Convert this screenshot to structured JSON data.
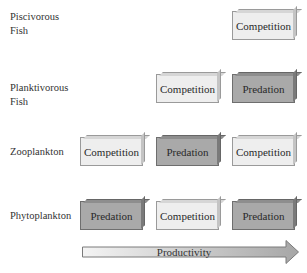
{
  "rows": [
    {
      "label_lines": [
        "Piscivorous",
        "Fish"
      ],
      "cells": [
        null,
        null,
        "Competition"
      ]
    },
    {
      "label_lines": [
        "Planktivorous",
        "Fish"
      ],
      "cells": [
        null,
        "Competition",
        "Predation"
      ]
    },
    {
      "label_lines": [
        "Zooplankton"
      ],
      "cells": [
        "Competition",
        "Predation",
        "Competition"
      ]
    },
    {
      "label_lines": [
        "Phytoplankton"
      ],
      "cells": [
        "Predation",
        "Competition",
        "Predation"
      ]
    }
  ],
  "labels": {
    "piscivorous_1": "Piscivorous",
    "piscivorous_2": "Fish",
    "planktivorous_1": "Planktivorous",
    "planktivorous_2": "Fish",
    "zooplankton": "Zooplankton",
    "phytoplankton": "Phytoplankton"
  },
  "boxes": {
    "r1c3": "Competition",
    "r2c2": "Competition",
    "r2c3": "Predation",
    "r3c1": "Competition",
    "r3c2": "Predation",
    "r3c3": "Competition",
    "r4c1": "Predation",
    "r4c2": "Competition",
    "r4c3": "Predation"
  },
  "axis": {
    "label": "Productivity",
    "direction": "increasing-right"
  },
  "colors": {
    "competition_fill": "#eeeeee",
    "predation_fill": "#a9a9a9",
    "arrow_start": "#f2f2f2",
    "arrow_end": "#a8a8a8"
  }
}
